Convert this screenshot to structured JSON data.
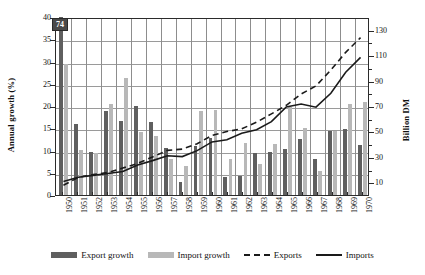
{
  "chart_data": {
    "type": "bar",
    "title": "",
    "subtitle": "",
    "xlabel": "",
    "ylabel": "Annual growth (%)",
    "y2label": "Billion DM",
    "ylim": [
      0,
      40
    ],
    "ytick_step": 5,
    "y2lim": [
      0,
      140
    ],
    "y2_ticks": [
      10,
      30,
      50,
      70,
      90,
      110,
      130
    ],
    "y2_minor_ticks": [
      20,
      40,
      60,
      80,
      100,
      120
    ],
    "grid": "horizontal",
    "legend_position": "bottom",
    "categories": [
      "1950",
      "1951",
      "1952",
      "1953",
      "1954",
      "1955",
      "1956",
      "1957",
      "1958",
      "1959",
      "1960",
      "1961",
      "1962",
      "1963",
      "1964",
      "1965",
      "1966",
      "1967",
      "1968",
      "1969",
      "1970"
    ],
    "y_tick_labels": [
      "0",
      "5",
      "10",
      "15",
      "20",
      "25",
      "30",
      "35",
      "40"
    ],
    "series": [
      {
        "name": "Export growth",
        "kind": "bar",
        "axis": "left",
        "unit": "%",
        "color": "#5f5f5f",
        "values": [
          74.0,
          16.0,
          9.6,
          18.8,
          16.7,
          20.0,
          16.5,
          10.5,
          2.9,
          11.1,
          12.9,
          4.1,
          4.3,
          9.4,
          9.7,
          10.4,
          12.5,
          8.0,
          14.3,
          14.8,
          11.2
        ],
        "clipped_points": [
          {
            "category": "1950",
            "value": 74,
            "label": "74"
          }
        ]
      },
      {
        "name": "Import growth",
        "kind": "bar",
        "axis": "left",
        "unit": "%",
        "color": "#b8b8b8",
        "values": [
          29.5,
          10.2,
          9.5,
          20.5,
          26.2,
          14.1,
          13.2,
          8.1,
          6.6,
          19.0,
          19.2,
          8.0,
          11.6,
          7.0,
          11.5,
          19.7,
          15.0,
          5.4,
          14.5,
          20.5,
          21.0
        ]
      },
      {
        "name": "Exports",
        "kind": "line",
        "style": "dashed",
        "axis": "right",
        "unit": "Billion DM",
        "color": "#1a1a1a",
        "values": [
          8.4,
          14.6,
          16.9,
          18.5,
          22.0,
          25.7,
          30.8,
          36.0,
          37.0,
          41.2,
          47.9,
          50.9,
          53.0,
          58.3,
          64.9,
          71.7,
          80.6,
          87.0,
          99.6,
          113.6,
          125.3
        ]
      },
      {
        "name": "Imports",
        "kind": "line",
        "style": "solid",
        "axis": "right",
        "unit": "Billion DM",
        "color": "#1a1a1a",
        "values": [
          11.4,
          14.7,
          16.2,
          17.7,
          19.3,
          24.5,
          27.9,
          31.7,
          31.1,
          35.8,
          42.7,
          44.4,
          49.5,
          52.3,
          58.8,
          70.4,
          72.7,
          70.2,
          81.2,
          97.9,
          109.6
        ]
      }
    ],
    "legend": [
      {
        "label": "Export growth",
        "marker": "bar-dark"
      },
      {
        "label": "Import growth",
        "marker": "bar-light"
      },
      {
        "label": "Exports",
        "marker": "line-dashed"
      },
      {
        "label": "Imports",
        "marker": "line-solid"
      }
    ],
    "colors": {
      "export_bar": "#5f5f5f",
      "import_bar": "#b8b8b8",
      "line": "#1a1a1a",
      "grid": "#9a9a9a",
      "axis": "#2b2b2b",
      "callout_bg": "#4a4a4a",
      "callout_text": "#ffffff"
    }
  }
}
